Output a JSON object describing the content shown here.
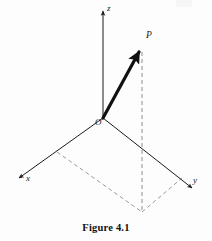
{
  "figure": {
    "caption": "Figure  4.1",
    "background_color": "#fdfdfd",
    "ink_color": "#1a1a1a",
    "dash_color": "#9a9a9a",
    "labels": {
      "z_axis": "z",
      "x_axis": "x",
      "y_axis": "y",
      "origin": "O",
      "point": "P"
    },
    "geometry": {
      "origin": [
        103,
        118
      ],
      "z_axis_tip": [
        103,
        8
      ],
      "x_axis_tip": [
        15,
        181
      ],
      "y_axis_tip": [
        197,
        192
      ],
      "point_P": [
        142,
        47
      ],
      "projection_foot": [
        142,
        212
      ],
      "parallelogram": [
        [
          103,
          118
        ],
        [
          57,
          152
        ],
        [
          142,
          212
        ],
        [
          182,
          178
        ]
      ]
    },
    "styles": {
      "axis_stroke_width": 1.0,
      "vector_stroke_width": 3.2,
      "dash_pattern": "4 3"
    }
  }
}
